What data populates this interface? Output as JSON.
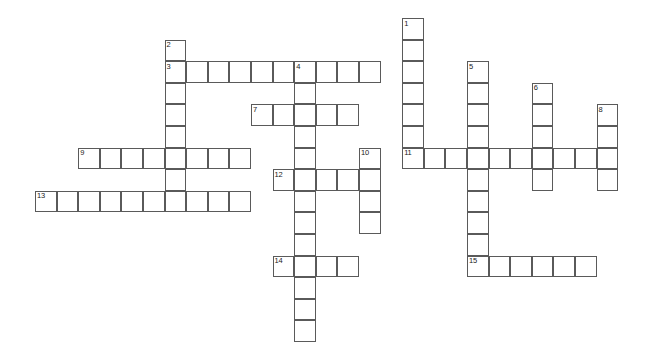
{
  "puzzle": {
    "title": "Crossword Grid",
    "grid": {
      "origin_x": 35,
      "origin_y": 18,
      "cell_size": 21.6,
      "border_color": "#5a5a5a",
      "cell_fill": "#ffffff",
      "background": "#ffffff",
      "number_color": "#1a1a1a"
    },
    "entries": [
      {
        "number": "1",
        "direction": "down",
        "col": 17,
        "row": 0,
        "length": 7
      },
      {
        "number": "2",
        "direction": "down",
        "col": 6,
        "row": 1,
        "length": 7
      },
      {
        "number": "3",
        "direction": "across",
        "col": 6,
        "row": 2,
        "length": 10
      },
      {
        "number": "4",
        "direction": "down",
        "col": 12,
        "row": 2,
        "length": 5
      },
      {
        "number": "5",
        "direction": "down",
        "col": 20,
        "row": 2,
        "length": 7
      },
      {
        "number": "6",
        "direction": "down",
        "col": 23,
        "row": 3,
        "length": 5
      },
      {
        "number": "7",
        "direction": "across",
        "col": 10,
        "row": 4,
        "length": 5
      },
      {
        "number": "8",
        "direction": "down",
        "col": 26,
        "row": 4,
        "length": 4
      },
      {
        "number": "9",
        "direction": "across",
        "col": 2,
        "row": 6,
        "length": 8
      },
      {
        "number": "10",
        "direction": "down",
        "col": 15,
        "row": 6,
        "length": 4
      },
      {
        "number": "11",
        "direction": "across",
        "col": 17,
        "row": 6,
        "length": 10
      },
      {
        "number": "12",
        "direction": "across",
        "col": 11,
        "row": 7,
        "length": 4
      },
      {
        "number": "13",
        "direction": "across",
        "col": 0,
        "row": 8,
        "length": 10
      },
      {
        "number": "14",
        "direction": "across",
        "col": 11,
        "row": 11,
        "length": 4
      },
      {
        "number": "15",
        "direction": "across",
        "col": 20,
        "row": 11,
        "length": 6
      }
    ],
    "extra_cells": [
      {
        "col": 12,
        "row": 7
      },
      {
        "col": 12,
        "row": 8
      },
      {
        "col": 12,
        "row": 9
      },
      {
        "col": 12,
        "row": 10
      },
      {
        "col": 12,
        "row": 12
      },
      {
        "col": 12,
        "row": 13
      },
      {
        "col": 12,
        "row": 14
      },
      {
        "col": 20,
        "row": 9
      },
      {
        "col": 20,
        "row": 10
      }
    ],
    "letters": []
  }
}
